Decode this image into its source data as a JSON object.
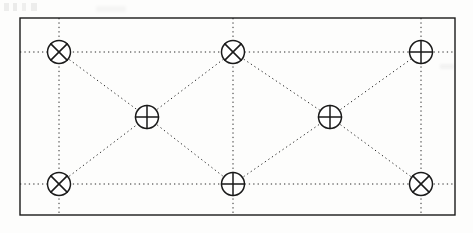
{
  "figure": {
    "background_color": "#fdfdfc",
    "line_color": "#1a1a1a",
    "dotted_color": "#2b2b2b",
    "frame": {
      "name": "outer-rectangle",
      "x": 20,
      "y": 18,
      "width": 435,
      "height": 197,
      "stroke_width": 1.4,
      "fill": "none"
    },
    "marker_types": {
      "cross_diagonal": "circle-x-node",
      "cross_axial": "circle-plus-node"
    },
    "node_radius": 11.5,
    "nodes": [
      {
        "id": "n1",
        "label": "top-left",
        "x": 59,
        "y": 52,
        "marker": "cross_diagonal"
      },
      {
        "id": "n2",
        "label": "top-middle",
        "x": 233,
        "y": 52,
        "marker": "cross_diagonal"
      },
      {
        "id": "n3",
        "label": "top-right",
        "x": 421,
        "y": 52,
        "marker": "cross_axial"
      },
      {
        "id": "n4",
        "label": "mid-left",
        "x": 147,
        "y": 117,
        "marker": "cross_axial"
      },
      {
        "id": "n5",
        "label": "mid-right",
        "x": 330,
        "y": 117,
        "marker": "cross_axial"
      },
      {
        "id": "n6",
        "label": "bottom-left",
        "x": 59,
        "y": 184,
        "marker": "cross_diagonal"
      },
      {
        "id": "n7",
        "label": "bottom-middle",
        "x": 233,
        "y": 184,
        "marker": "cross_axial"
      },
      {
        "id": "n8",
        "label": "bottom-right",
        "x": 421,
        "y": 184,
        "marker": "cross_diagonal"
      }
    ],
    "horizontal_lines": [
      {
        "name": "upper-horizontal-guide",
        "y": 52,
        "x1": 20,
        "x2": 455
      },
      {
        "name": "lower-horizontal-guide",
        "y": 184,
        "x1": 20,
        "x2": 455
      }
    ],
    "vertical_lines": [
      {
        "name": "left-vertical-guide",
        "x": 59,
        "y1": 18,
        "y2": 215
      },
      {
        "name": "center-vertical-guide",
        "x": 233,
        "y1": 18,
        "y2": 215
      },
      {
        "name": "right-vertical-guide",
        "x": 421,
        "y1": 18,
        "y2": 215
      }
    ],
    "diagonal_edges": [
      {
        "name": "edge-n1-n4",
        "x1": 59,
        "y1": 52,
        "x2": 147,
        "y2": 117
      },
      {
        "name": "edge-n4-n2",
        "x1": 147,
        "y1": 117,
        "x2": 233,
        "y2": 52
      },
      {
        "name": "edge-n2-n5",
        "x1": 233,
        "y1": 52,
        "x2": 330,
        "y2": 117
      },
      {
        "name": "edge-n5-n3",
        "x1": 330,
        "y1": 117,
        "x2": 421,
        "y2": 52
      },
      {
        "name": "edge-n6-n4",
        "x1": 59,
        "y1": 184,
        "x2": 147,
        "y2": 117
      },
      {
        "name": "edge-n4-n7",
        "x1": 147,
        "y1": 117,
        "x2": 233,
        "y2": 184
      },
      {
        "name": "edge-n7-n5",
        "x1": 233,
        "y1": 184,
        "x2": 330,
        "y2": 117
      },
      {
        "name": "edge-n5-n8",
        "x1": 330,
        "y1": 117,
        "x2": 421,
        "y2": 184
      }
    ]
  }
}
